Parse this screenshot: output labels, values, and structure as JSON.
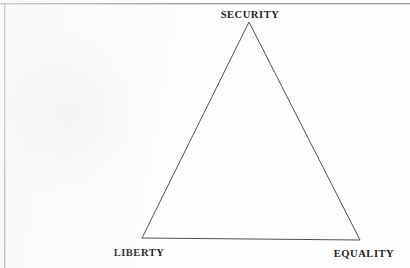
{
  "figure": {
    "background_color": "#fdfdfd",
    "frame": {
      "name": "page-border",
      "color": "#9a9a9a",
      "sides": [
        "top",
        "left"
      ]
    },
    "shape": {
      "type": "triangle",
      "stroke_color": "#4f4f4f",
      "fill": "none",
      "stroke_width": 1,
      "vertices": [
        {
          "id": "apex",
          "label_key": "security",
          "x": 249,
          "y": 22
        },
        {
          "id": "bottom-left",
          "label_key": "liberty",
          "x": 142,
          "y": 238
        },
        {
          "id": "bottom-right",
          "label_key": "equality",
          "x": 360,
          "y": 240
        }
      ]
    },
    "labels": {
      "security": "SECURITY",
      "liberty": "LIBERTY",
      "equality": "EQUALITY"
    }
  }
}
